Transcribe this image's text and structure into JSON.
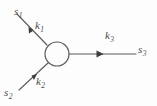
{
  "figure": {
    "type": "vertex-diagram",
    "title": "",
    "background_color": "#fdfdfd",
    "stroke_color": "#5a5a5a",
    "label_color": "#4a4a4a"
  },
  "node": {
    "name": "interaction-vertex",
    "shape": "circle",
    "cx": 57,
    "cy": 54,
    "r": 12,
    "fill": "none"
  },
  "labels": {
    "s1": {
      "base": "s",
      "sub": "1"
    },
    "k1": {
      "base": "k",
      "sub": "1"
    },
    "s2": {
      "base": "s",
      "sub": "2"
    },
    "k2": {
      "base": "k",
      "sub": "2"
    },
    "k3": {
      "base": "k",
      "sub": "3"
    },
    "s3": {
      "base": "s",
      "sub": "3"
    }
  },
  "edges": [
    {
      "name": "incoming-upper-left",
      "momentum": "k1",
      "source": "s1",
      "direction": "into-vertex",
      "x1": 17,
      "y1": 14,
      "x2": 47,
      "y2": 45,
      "arrow_at": {
        "x": 33,
        "y": 30
      }
    },
    {
      "name": "incoming-lower-left",
      "momentum": "k2",
      "source": "s2",
      "direction": "into-vertex",
      "x1": 19,
      "y1": 90,
      "x2": 48,
      "y2": 63,
      "arrow_at": {
        "x": 36,
        "y": 75
      }
    },
    {
      "name": "outgoing-right",
      "momentum": "k3",
      "target": "s3",
      "direction": "out-of-vertex",
      "x1": 69,
      "y1": 54,
      "x2": 136,
      "y2": 54,
      "arrow_at": {
        "x": 101,
        "y": 54
      }
    }
  ]
}
